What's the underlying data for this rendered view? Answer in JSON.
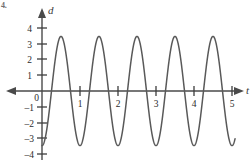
{
  "problem_label": "4.",
  "chart_data": {
    "type": "line",
    "title": "",
    "xlabel": "t",
    "ylabel": "d",
    "grid": false,
    "legend": null,
    "xlim": [
      -0.28,
      5.22
    ],
    "ylim": [
      -4.35,
      4.35
    ],
    "x_ticks": [
      1,
      2,
      3,
      4,
      5
    ],
    "x_tick_labels": [
      "1",
      "2",
      "3",
      "4",
      "5"
    ],
    "y_ticks": [
      4,
      3,
      2,
      1,
      0,
      -1,
      -2,
      -3,
      -4
    ],
    "y_tick_labels": [
      "4",
      "3",
      "2",
      "1",
      "0",
      "–1",
      "–2",
      "–3",
      "–4"
    ],
    "origin_label": "0",
    "series": [
      {
        "name": "d(t)",
        "equation": "d = -3.5*cos(2*pi*t)",
        "amplitude": 3.5,
        "period": 1,
        "midline": 0,
        "phase": "starts at minimum",
        "x_start": 0,
        "x_end": 5.08,
        "color": "#595959",
        "peaks_at": [
          0.5,
          1.5,
          2.5,
          3.5,
          4.5
        ],
        "peak_value": 3.5,
        "troughs_at": [
          0,
          1,
          2,
          3,
          4,
          5
        ],
        "trough_value": -3.5
      }
    ]
  },
  "axes": {
    "x_axis_arrow": "both-ends",
    "y_axis_arrow": "up",
    "x_label": "t",
    "y_label": "d"
  }
}
